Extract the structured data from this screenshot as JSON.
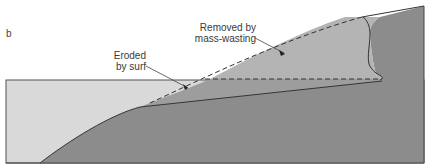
{
  "panel_letter": "b",
  "labels": {
    "eroded": {
      "line1": "Eroded",
      "line2": "by surf"
    },
    "removed": {
      "line1": "Removed by",
      "line2": "mass-wasting"
    }
  },
  "colors": {
    "water": "#d9d9d9",
    "bedrock": "#8c8c8c",
    "removed_mass": "#b4b4b4",
    "eroded_wedge": "#9d9d9d",
    "outline": "#333333",
    "background": "#ffffff"
  }
}
